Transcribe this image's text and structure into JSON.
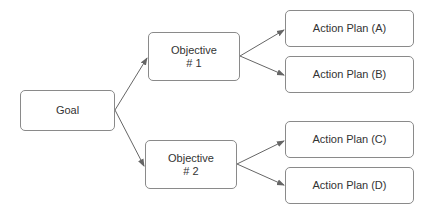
{
  "diagram": {
    "type": "tree",
    "colors": {
      "border": "#8a8a8a",
      "edge": "#666666",
      "text": "#333333",
      "background": "#ffffff"
    },
    "nodes": {
      "goal": {
        "label": "Goal"
      },
      "objective1": {
        "line1": "Objective",
        "line2": "# 1"
      },
      "objective2": {
        "line1": "Objective",
        "line2": "# 2"
      },
      "actionA": {
        "label": "Action Plan (A)"
      },
      "actionB": {
        "label": "Action Plan (B)"
      },
      "actionC": {
        "label": "Action Plan (C)"
      },
      "actionD": {
        "label": "Action Plan (D)"
      }
    },
    "edges": [
      {
        "from": "goal",
        "to": "objective1"
      },
      {
        "from": "goal",
        "to": "objective2"
      },
      {
        "from": "objective1",
        "to": "actionA"
      },
      {
        "from": "objective1",
        "to": "actionB"
      },
      {
        "from": "objective2",
        "to": "actionC"
      },
      {
        "from": "objective2",
        "to": "actionD"
      }
    ]
  }
}
